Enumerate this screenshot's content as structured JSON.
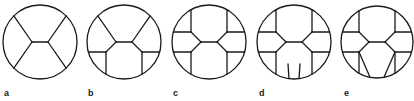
{
  "figure": {
    "panels": [
      {
        "label": "a",
        "cx": 40,
        "cy": 42,
        "r": 37,
        "variant": "a"
      },
      {
        "label": "b",
        "cx": 124,
        "cy": 42,
        "r": 37,
        "variant": "b"
      },
      {
        "label": "c",
        "cx": 209,
        "cy": 42,
        "r": 37,
        "variant": "c"
      },
      {
        "label": "d",
        "cx": 294,
        "cy": 42,
        "r": 37,
        "variant": "d"
      },
      {
        "label": "e",
        "cx": 377,
        "cy": 42,
        "r": 36,
        "variant": "e"
      }
    ],
    "label_positions": [
      {
        "x": 4,
        "y": 96
      },
      {
        "x": 88,
        "y": 96
      },
      {
        "x": 173,
        "y": 96
      },
      {
        "x": 259,
        "y": 96
      },
      {
        "x": 344,
        "y": 96
      }
    ],
    "stroke_color": "#1a1a1a",
    "background": "#ffffff"
  }
}
